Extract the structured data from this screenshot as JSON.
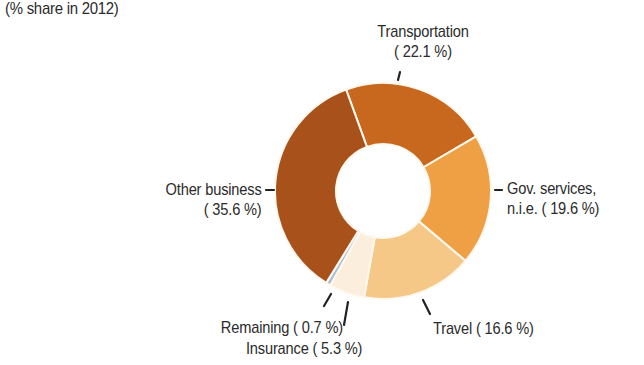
{
  "subtitle": "(% share in 2012)",
  "chart_data": {
    "type": "pie",
    "variant": "donut",
    "title": "",
    "subtitle": "(% share in 2012)",
    "categories": [
      "Transportation",
      "Gov. services, n.i.e.",
      "Travel",
      "Insurance",
      "Remaining",
      "Other business"
    ],
    "values": [
      22.1,
      19.6,
      16.6,
      5.3,
      0.7,
      35.6
    ],
    "colors": [
      "#c8681e",
      "#f0a044",
      "#f6c888",
      "#fbeedd",
      "#a8c0d8",
      "#a9511a"
    ],
    "start_angle_deg": -20,
    "direction": "clockwise",
    "legend": "none (labels placed around donut)"
  },
  "labels": {
    "transportation": {
      "line1": "Transportation",
      "line2": "( 22.1 %)"
    },
    "gov": {
      "line1": "Gov. services,",
      "line2": "n.i.e. ( 19.6 %)"
    },
    "travel": {
      "line1": "Travel ( 16.6 %)"
    },
    "insurance": {
      "line1": "Insurance (  5.3 %)"
    },
    "remaining": {
      "line1": "Remaining (  0.7 %)"
    },
    "other": {
      "line1": "Other business",
      "line2": "( 35.6 %)"
    }
  }
}
